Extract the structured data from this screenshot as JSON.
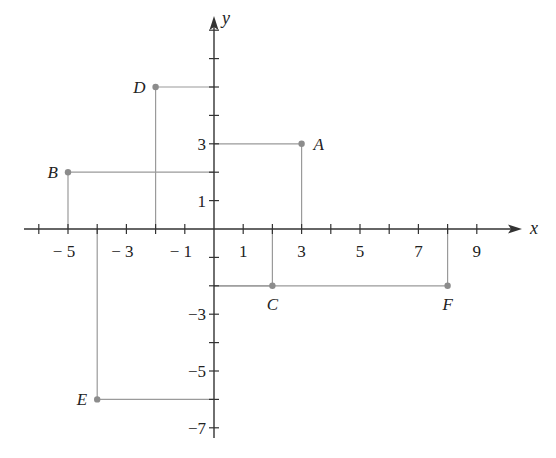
{
  "chart_data": {
    "type": "scatter",
    "title": "",
    "xlabel": "x",
    "ylabel": "y",
    "xlim": [
      -6,
      10
    ],
    "ylim": [
      -7,
      8
    ],
    "grid": false,
    "x_tick_labels": [
      "-5",
      "-3",
      "-1",
      "1",
      "3",
      "5",
      "7",
      "9"
    ],
    "y_tick_labels": [
      "3",
      "1",
      "-3",
      "-5",
      "-7"
    ],
    "points": [
      {
        "label": "A",
        "x": 3,
        "y": 3
      },
      {
        "label": "B",
        "x": -5,
        "y": 2
      },
      {
        "label": "C",
        "x": 2,
        "y": -2
      },
      {
        "label": "D",
        "x": -2,
        "y": 5
      },
      {
        "label": "E",
        "x": -4,
        "y": -6
      },
      {
        "label": "F",
        "x": 8,
        "y": -2
      }
    ],
    "projection_lines": true
  },
  "colors": {
    "axis": "#333333",
    "guide": "#9a9a9a",
    "point": "#8c8c8c",
    "text": "#222222"
  }
}
